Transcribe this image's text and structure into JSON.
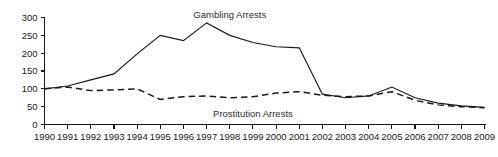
{
  "chart_data": {
    "type": "line",
    "title": "",
    "subtitle": "",
    "xlabel": "",
    "ylabel": "",
    "xlim": [
      1990,
      2009
    ],
    "ylim": [
      0,
      300
    ],
    "grid": false,
    "legend_position": "inline-annotation",
    "x": [
      1990,
      1991,
      1992,
      1993,
      1994,
      1995,
      1996,
      1997,
      1998,
      1999,
      2000,
      2001,
      2002,
      2003,
      2004,
      2005,
      2006,
      2007,
      2008,
      2009
    ],
    "xticklabels": [
      "1990",
      "1991",
      "1992",
      "1993",
      "1994",
      "1995",
      "1996",
      "1997",
      "1998",
      "1999",
      "2000",
      "2001",
      "2002",
      "2003",
      "2004",
      "2005",
      "2006",
      "2007",
      "2008",
      "2009"
    ],
    "yticks": [
      0,
      50,
      100,
      150,
      200,
      250,
      300
    ],
    "yticklabels": [
      "0",
      "50",
      "100",
      "150",
      "200",
      "250",
      "300"
    ],
    "series": [
      {
        "name": "Gambling Arrests",
        "style": "solid",
        "color": "#1a1a1a",
        "label_x": 1998,
        "label_y": 300,
        "values": [
          100,
          108,
          125,
          142,
          198,
          250,
          235,
          285,
          250,
          230,
          218,
          215,
          85,
          75,
          80,
          105,
          75,
          60,
          52,
          48
        ]
      },
      {
        "name": "Prostitution Arrests",
        "style": "dashed",
        "color": "#1a1a1a",
        "label_x": 1999,
        "label_y": 22,
        "values": [
          100,
          105,
          95,
          97,
          100,
          70,
          78,
          80,
          75,
          78,
          88,
          92,
          82,
          78,
          80,
          92,
          68,
          55,
          50,
          47
        ]
      }
    ]
  },
  "annotations": {
    "gambling_label": "Gambling Arrests",
    "prostitution_label": "Prostitution Arrests"
  }
}
